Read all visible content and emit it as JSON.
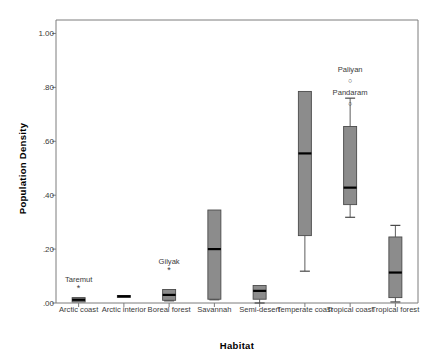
{
  "chart_data": {
    "type": "box",
    "title": "",
    "xlabel": "Habitat",
    "ylabel": "Population Density",
    "ylim": [
      0.0,
      1.05
    ],
    "ytick_labels": [
      ".00",
      ".20",
      ".40",
      ".60",
      ".80",
      "1.00"
    ],
    "ytick_values": [
      0.0,
      0.2,
      0.4,
      0.6,
      0.8,
      1.0
    ],
    "grid": false,
    "legend": "none",
    "box_fill": "#8c8c8c",
    "box_edge": "#4a4a4a",
    "median_color": "#000000",
    "categories": [
      "Arctic coast",
      "Arctic interior",
      "Boreal forest",
      "Savannah",
      "Semi-desert",
      "Temperate coast",
      "Tropical coast",
      "Tropical forest"
    ],
    "boxes": [
      {
        "category": "Arctic coast",
        "whisker_low": 0.01,
        "q1": 0.004,
        "median": 0.012,
        "q3": 0.02,
        "whisker_high": 0.02
      },
      {
        "category": "Arctic interior",
        "whisker_low": 0.024,
        "q1": 0.022,
        "median": 0.025,
        "q3": 0.028,
        "whisker_high": 0.028
      },
      {
        "category": "Boreal forest",
        "whisker_low": 0.008,
        "q1": 0.01,
        "median": 0.03,
        "q3": 0.05,
        "whisker_high": 0.05
      },
      {
        "category": "Savannah",
        "whisker_low": 0.012,
        "q1": 0.014,
        "median": 0.2,
        "q3": 0.345,
        "whisker_high": 0.345
      },
      {
        "category": "Semi-desert",
        "whisker_low": 0.0,
        "q1": 0.014,
        "median": 0.045,
        "q3": 0.065,
        "whisker_high": 0.065
      },
      {
        "category": "Temperate coast",
        "whisker_low": 0.118,
        "q1": 0.25,
        "median": 0.555,
        "q3": 0.785,
        "whisker_high": 0.785
      },
      {
        "category": "Tropical coast",
        "whisker_low": 0.318,
        "q1": 0.365,
        "median": 0.428,
        "q3": 0.655,
        "whisker_high": 0.76
      },
      {
        "category": "Tropical forest",
        "whisker_low": 0.004,
        "q1": 0.02,
        "median": 0.113,
        "q3": 0.245,
        "whisker_high": 0.288
      }
    ],
    "annotations": [
      {
        "text": "Taremut",
        "marker": "*",
        "category": "Arctic coast",
        "value": 0.065
      },
      {
        "text": "Gilyak",
        "marker": "*",
        "category": "Boreal forest",
        "value": 0.135
      },
      {
        "text": "Paliyan",
        "marker": "○",
        "category": "Tropical coast",
        "value": 0.845
      },
      {
        "text": "Pandaram",
        "marker": "○",
        "category": "Tropical coast",
        "value": 0.76
      }
    ]
  }
}
